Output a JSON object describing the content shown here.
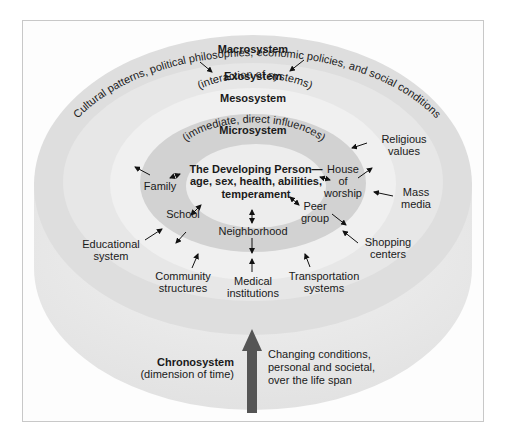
{
  "colors": {
    "frame_border": "#c8c8c8",
    "macro": "#dedede",
    "exo": "#e9e9e9",
    "meso": "#efefef",
    "micro": "#d0d0d0",
    "person": "#ececec",
    "cylinder_side": "#e6e6e6",
    "arrow": "#111111",
    "chrono_arrow": "#555555"
  },
  "systems": {
    "macro": {
      "title": "Macrosystem",
      "desc": "Cultural patterns, political philosophies, economic policies, and social conditions"
    },
    "exo": {
      "title": "Exosystem"
    },
    "meso": {
      "title": "Mesosystem",
      "desc": "(interaction of systems)"
    },
    "micro": {
      "title": "Microsystem",
      "desc": "(immediate, direct influences)"
    },
    "person": {
      "line1": "The Developing Person—",
      "line2": "age, sex, health, abilities,",
      "line3": "temperament"
    },
    "chrono": {
      "title": "Chronosystem",
      "desc": "(dimension of time)",
      "note1": "Changing conditions,",
      "note2": "personal and societal,",
      "note3": "over the life span"
    }
  },
  "micro_items": {
    "family": "Family",
    "school": "School",
    "neighborhood": "Neighborhood",
    "peer_line1": "Peer",
    "peer_line2": "group",
    "worship_line1": "House",
    "worship_line2": "of",
    "worship_line3": "worship"
  },
  "exo_items": {
    "religious_line1": "Religious",
    "religious_line2": "values",
    "mass_line1": "Mass",
    "mass_line2": "media",
    "educational_line1": "Educational",
    "educational_line2": "system",
    "community_line1": "Community",
    "community_line2": "structures",
    "medical_line1": "Medical",
    "medical_line2": "institutions",
    "transport_line1": "Transportation",
    "transport_line2": "systems",
    "shopping_line1": "Shopping",
    "shopping_line2": "centers"
  }
}
